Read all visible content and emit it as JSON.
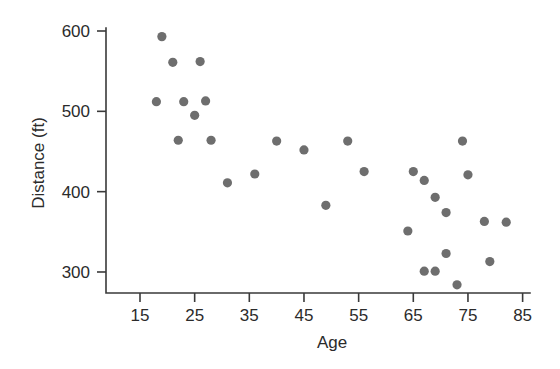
{
  "chart_data": {
    "type": "scatter",
    "title": "",
    "xlabel": "Age",
    "ylabel": "Distance (ft)",
    "xlim": [
      10,
      85
    ],
    "ylim": [
      275,
      615
    ],
    "grid": false,
    "legend": null,
    "marker_color": "#6e6e6e",
    "axis_color": "#3a3a3a",
    "xticks": [
      15,
      25,
      35,
      45,
      55,
      65,
      75,
      85
    ],
    "xtick_labels": [
      "15",
      "25",
      "35",
      "45",
      "55",
      "65",
      "75",
      "85"
    ],
    "yticks": [
      300,
      400,
      500,
      600
    ],
    "ytick_labels": [
      "300",
      "400",
      "500",
      "600"
    ],
    "points": [
      {
        "x": 19,
        "y": 593
      },
      {
        "x": 21,
        "y": 561
      },
      {
        "x": 26,
        "y": 562
      },
      {
        "x": 18,
        "y": 512
      },
      {
        "x": 23,
        "y": 512
      },
      {
        "x": 27,
        "y": 513
      },
      {
        "x": 25,
        "y": 495
      },
      {
        "x": 22,
        "y": 464
      },
      {
        "x": 28,
        "y": 464
      },
      {
        "x": 31,
        "y": 411
      },
      {
        "x": 36,
        "y": 422
      },
      {
        "x": 40,
        "y": 463
      },
      {
        "x": 45,
        "y": 452
      },
      {
        "x": 49,
        "y": 383
      },
      {
        "x": 53,
        "y": 463
      },
      {
        "x": 56,
        "y": 425
      },
      {
        "x": 64,
        "y": 351
      },
      {
        "x": 65,
        "y": 425
      },
      {
        "x": 67,
        "y": 414
      },
      {
        "x": 67,
        "y": 301
      },
      {
        "x": 69,
        "y": 301
      },
      {
        "x": 69,
        "y": 393
      },
      {
        "x": 71,
        "y": 323
      },
      {
        "x": 71,
        "y": 374
      },
      {
        "x": 73,
        "y": 284
      },
      {
        "x": 74,
        "y": 463
      },
      {
        "x": 75,
        "y": 421
      },
      {
        "x": 78,
        "y": 363
      },
      {
        "x": 79,
        "y": 313
      },
      {
        "x": 82,
        "y": 362
      }
    ]
  }
}
